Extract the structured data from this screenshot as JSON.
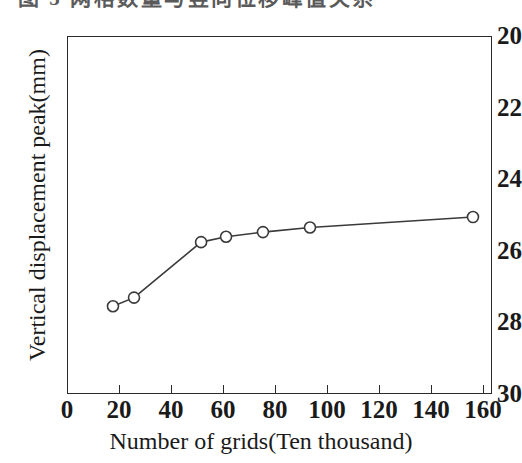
{
  "figure": {
    "top_cropped_caption": "图 5  网格数量与竖向位移峰值关系"
  },
  "chart_data": {
    "type": "line",
    "title": "",
    "xlabel": "Number of grids(Ten thousand)",
    "ylabel": "Vertical displacement peak(mm)",
    "xlim": [
      0,
      163.5
    ],
    "ylim": [
      20,
      30
    ],
    "y_axis_inverted": true,
    "grid": false,
    "legend": "none",
    "xticks": [
      0,
      20,
      40,
      60,
      80,
      100,
      120,
      140,
      160
    ],
    "xtick_labels": [
      "0",
      "20",
      "40",
      "60",
      "80",
      "100",
      "120",
      "140",
      "160"
    ],
    "yticks": [
      20,
      22,
      24,
      26,
      28,
      30
    ],
    "ytick_labels": [
      "20",
      "22",
      "24",
      "26",
      "28",
      "30"
    ],
    "marker": "open-circle",
    "marker_size": 11,
    "line_color": "#3a3a3a",
    "marker_edge_color": "#3a3a3a",
    "marker_face_color": "#ffffff",
    "series": [
      {
        "name": "Vertical displacement peak",
        "x": [
          17.3,
          25.4,
          51.2,
          60.8,
          75.0,
          93.1,
          155.8
        ],
        "y": [
          27.52,
          27.28,
          25.73,
          25.58,
          25.45,
          25.32,
          25.03
        ]
      }
    ]
  }
}
